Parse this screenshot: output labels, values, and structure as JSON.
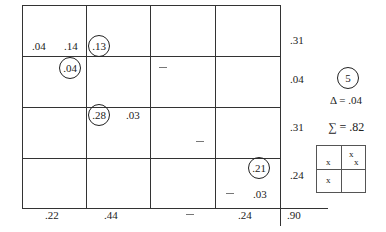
{
  "grid": {
    "rows": 4,
    "cols": 4,
    "cells": {
      "r0c0_left": ".04",
      "r0c0_right": ".14",
      "r0c1_circled": ".13",
      "r1c0_circled": ".04",
      "r1c2_dash": "—",
      "r2c1_circled": ".28",
      "r2c1_right": ".03",
      "r2c2_dash": "—",
      "r3c3_circled": ".21",
      "r3c3_dash": "—",
      "r3c3_bottom": ".03"
    }
  },
  "row_totals": [
    ".31",
    ".04",
    ".31",
    ".24"
  ],
  "col_totals": [
    ".22",
    ".44",
    "—",
    ".24"
  ],
  "grand_total": ".90",
  "side_panel": {
    "step_number": "5",
    "delta_label": "Δ = .04",
    "sum_label": "∑ = .82",
    "mini_grid": {
      "top_left": "x",
      "top_right_1": "x",
      "top_right_2": "x",
      "bottom_left": "x"
    }
  }
}
